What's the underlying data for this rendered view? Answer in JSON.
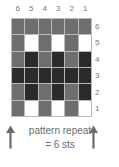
{
  "chart_data": {
    "type": "heatmap",
    "title": "pattern repeat = 6 sts",
    "columns": 6,
    "rows": 6,
    "column_labels": [
      "6",
      "5",
      "4",
      "3",
      "2",
      "1"
    ],
    "row_labels": [
      "6",
      "5",
      "4",
      "3",
      "2",
      "1"
    ],
    "legend": [
      {
        "key": "gray",
        "color": "#6e6e6e"
      },
      {
        "key": "dark",
        "color": "#2b2b2b"
      },
      {
        "key": "white",
        "color": "#ffffff"
      }
    ],
    "grid_line_color": "#b9b9b9",
    "cells": [
      [
        "gray",
        "gray",
        "gray",
        "gray",
        "gray",
        "gray"
      ],
      [
        "gray",
        "white",
        "gray",
        "white",
        "gray",
        "white"
      ],
      [
        "gray",
        "dark",
        "gray",
        "dark",
        "gray",
        "dark"
      ],
      [
        "dark",
        "dark",
        "dark",
        "dark",
        "dark",
        "dark"
      ],
      [
        "gray",
        "dark",
        "gray",
        "dark",
        "gray",
        "dark"
      ],
      [
        "gray",
        "white",
        "gray",
        "white",
        "gray",
        "white"
      ]
    ]
  },
  "caption": {
    "line_1": "pattern repeat",
    "line_2": "= 6 sts",
    "arrow_left_name": "up-arrow-icon",
    "arrow_right_name": "up-arrow-icon",
    "arrow_color": "#6b6b6b"
  }
}
